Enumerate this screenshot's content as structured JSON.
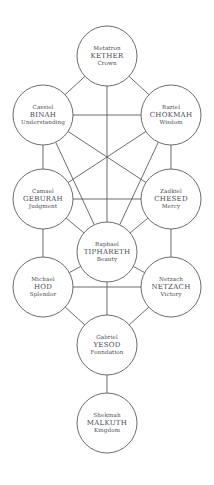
{
  "diagram": {
    "type": "kabbalistic-tree-of-life",
    "width": 214,
    "height": 485,
    "background_color": "#ffffff",
    "line_color": "#5b5b63",
    "text_color": "#4a4a52",
    "node_radius": 30
  },
  "nodes": [
    {
      "id": "kether",
      "angel": "Metatron",
      "sephira": "KETHER",
      "meaning": "Crown",
      "cx": 107,
      "cy": 56,
      "r": 30
    },
    {
      "id": "binah",
      "angel": "Cassiel",
      "sephira": "BINAH",
      "meaning": "Understanding",
      "cx": 43,
      "cy": 115,
      "r": 30
    },
    {
      "id": "chokmah",
      "angel": "Raziel",
      "sephira": "CHOKMAH",
      "meaning": "Wisdom",
      "cx": 171,
      "cy": 115,
      "r": 30
    },
    {
      "id": "geburah",
      "angel": "Camael",
      "sephira": "GEBURAH",
      "meaning": "Judgment",
      "cx": 43,
      "cy": 199,
      "r": 30
    },
    {
      "id": "chesed",
      "angel": "Zadkiel",
      "sephira": "CHESED",
      "meaning": "Mercy",
      "cx": 171,
      "cy": 199,
      "r": 30
    },
    {
      "id": "tiphareth",
      "angel": "Raphael",
      "sephira": "TIPHARETH",
      "meaning": "Beauty",
      "cx": 107,
      "cy": 252,
      "r": 30
    },
    {
      "id": "hod",
      "angel": "Michael",
      "sephira": "HOD",
      "meaning": "Splendor",
      "cx": 43,
      "cy": 287,
      "r": 30
    },
    {
      "id": "netzach",
      "angel": "Netzach",
      "sephira": "NETZACH",
      "meaning": "Victory",
      "cx": 171,
      "cy": 287,
      "r": 30
    },
    {
      "id": "yesod",
      "angel": "Gabriel",
      "sephira": "YESOD",
      "meaning": "Foundation",
      "cx": 107,
      "cy": 345,
      "r": 30
    },
    {
      "id": "malkuth",
      "angel": "Shekinah",
      "sephira": "MALKUTH",
      "meaning": "Kingdom",
      "cx": 107,
      "cy": 423,
      "r": 30
    }
  ],
  "paths": [
    {
      "from": "kether",
      "to": "binah"
    },
    {
      "from": "kether",
      "to": "chokmah"
    },
    {
      "from": "kether",
      "to": "tiphareth"
    },
    {
      "from": "binah",
      "to": "chokmah"
    },
    {
      "from": "binah",
      "to": "geburah"
    },
    {
      "from": "binah",
      "to": "tiphareth"
    },
    {
      "from": "binah",
      "to": "chesed"
    },
    {
      "from": "chokmah",
      "to": "chesed"
    },
    {
      "from": "chokmah",
      "to": "tiphareth"
    },
    {
      "from": "chokmah",
      "to": "geburah"
    },
    {
      "from": "geburah",
      "to": "chesed"
    },
    {
      "from": "geburah",
      "to": "tiphareth"
    },
    {
      "from": "geburah",
      "to": "hod"
    },
    {
      "from": "chesed",
      "to": "tiphareth"
    },
    {
      "from": "chesed",
      "to": "netzach"
    },
    {
      "from": "tiphareth",
      "to": "hod"
    },
    {
      "from": "tiphareth",
      "to": "netzach"
    },
    {
      "from": "tiphareth",
      "to": "yesod"
    },
    {
      "from": "hod",
      "to": "netzach"
    },
    {
      "from": "hod",
      "to": "yesod"
    },
    {
      "from": "netzach",
      "to": "yesod"
    },
    {
      "from": "yesod",
      "to": "malkuth"
    }
  ]
}
